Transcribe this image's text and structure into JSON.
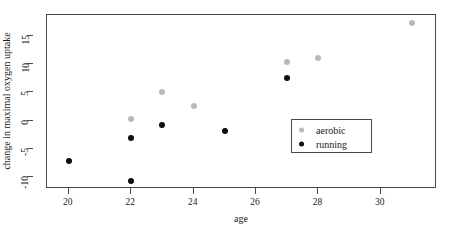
{
  "chart_data": {
    "type": "scatter",
    "title": "",
    "xlabel": "age",
    "ylabel": "change in maximal oxygen uptake",
    "xlim": [
      19.3,
      31.8
    ],
    "ylim": [
      -12.2,
      18.8
    ],
    "xticks": [
      20,
      22,
      24,
      26,
      28,
      30
    ],
    "xtick_labels": [
      "20",
      "22",
      "24",
      "26",
      "28",
      "30"
    ],
    "yticks": [
      -10,
      -5,
      0,
      5,
      10,
      15
    ],
    "ytick_labels": [
      "-10",
      "-5",
      "0",
      "5",
      "10",
      "15"
    ],
    "grid": false,
    "legend_position": "center-right",
    "series": [
      {
        "name": "aerobic",
        "color": "#b9b9b9",
        "marker": "circle",
        "points": [
          {
            "x": 22,
            "y": 0.2
          },
          {
            "x": 23,
            "y": 5.0
          },
          {
            "x": 24,
            "y": 2.6
          },
          {
            "x": 27,
            "y": 10.5
          },
          {
            "x": 28,
            "y": 11.2
          },
          {
            "x": 31,
            "y": 17.3
          }
        ]
      },
      {
        "name": "running",
        "color": "#0d0d0d",
        "marker": "circle",
        "points": [
          {
            "x": 20,
            "y": -7.3
          },
          {
            "x": 22,
            "y": -3.2
          },
          {
            "x": 22,
            "y": -10.7
          },
          {
            "x": 23,
            "y": -0.8
          },
          {
            "x": 25,
            "y": -1.8
          },
          {
            "x": 27,
            "y": 7.6
          }
        ]
      }
    ]
  },
  "legend": {
    "entries": [
      {
        "label": "aerobic",
        "key": "aerobic"
      },
      {
        "label": "running",
        "key": "running"
      }
    ]
  },
  "axes": {
    "x_title": "age",
    "y_title": "change in maximal oxygen uptake"
  }
}
